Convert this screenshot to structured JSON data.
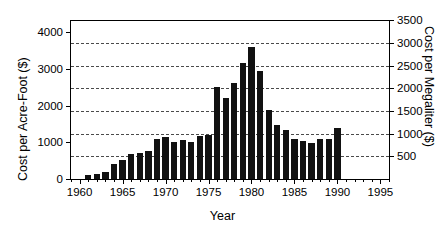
{
  "chart_data": {
    "type": "bar",
    "title": "",
    "xlabel": "Year",
    "ylabel": "Cost per Acre-Foot ($)",
    "ylabel_right": "Cost per Megaliter ($)",
    "xlim": [
      1959,
      1996
    ],
    "ylim": [
      0,
      4300
    ],
    "ylim_right": [
      0,
      3485
    ],
    "yticks": [
      0,
      1000,
      2000,
      3000,
      4000
    ],
    "ytick_labels": [
      "0",
      "1000",
      "2000",
      "3000",
      "4000"
    ],
    "yticks_right": [
      500,
      1000,
      1500,
      2000,
      2500,
      3000,
      3500
    ],
    "ytick_labels_right": [
      "500",
      "1000",
      "1500",
      "2000",
      "2500",
      "3000",
      "3500"
    ],
    "xticks": [
      1960,
      1965,
      1970,
      1975,
      1980,
      1985,
      1990,
      1995
    ],
    "xtick_labels": [
      "1960",
      "1965",
      "1970",
      "1975",
      "1980",
      "1985",
      "1990",
      "1995"
    ],
    "x_minor_tick_step": 1,
    "grid": "horizontal-dashed-aligned-to-right-axis",
    "legend": "none",
    "bar_color": "#111111",
    "categories": [
      1961,
      1962,
      1963,
      1964,
      1965,
      1966,
      1967,
      1968,
      1969,
      1970,
      1971,
      1972,
      1973,
      1974,
      1975,
      1976,
      1977,
      1978,
      1979,
      1980,
      1981,
      1982,
      1983,
      1984,
      1985,
      1986,
      1987,
      1988,
      1989,
      1990
    ],
    "values": [
      100,
      130,
      200,
      420,
      520,
      680,
      700,
      760,
      1080,
      1140,
      1020,
      1050,
      1020,
      1180,
      1200,
      2500,
      2200,
      2600,
      3150,
      3600,
      2950,
      1880,
      1480,
      1330,
      1100,
      1030,
      990,
      1080,
      1080,
      1380
    ],
    "value_unit": "dollars per acre-foot",
    "conversion_note": "right axis = left axis x 0.8107 (acre-foot to megaliter)"
  }
}
